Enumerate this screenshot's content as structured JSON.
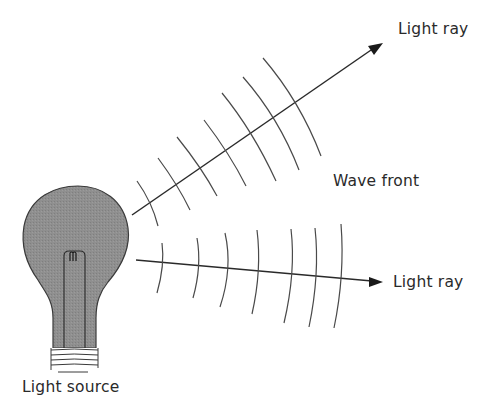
{
  "diagram": {
    "labels": {
      "upper_ray": "Light ray",
      "lower_ray": "Light ray",
      "wave_front": "Wave front",
      "source": "Light source"
    },
    "colors": {
      "bulb_fill": "#8f8f8f",
      "line": "#2a2a2a",
      "arc": "#4a4a4a",
      "background": "#ffffff"
    },
    "elements": {
      "light_source": "incandescent-bulb",
      "rays": 2,
      "upper_ray_wave_fronts": 7,
      "lower_ray_wave_fronts": 7
    }
  }
}
